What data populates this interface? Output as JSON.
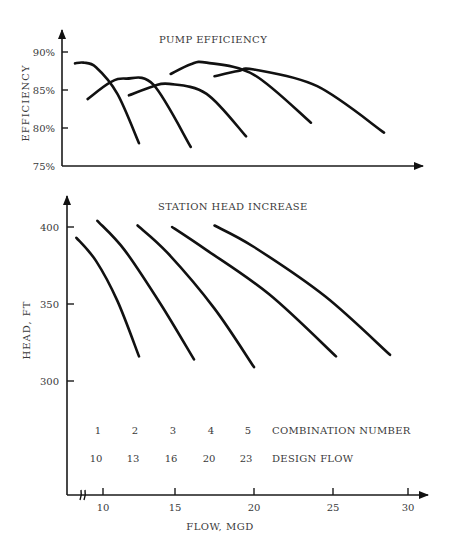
{
  "chart_data": [
    {
      "type": "line",
      "title": "PUMP EFFICIENCY",
      "xlabel": "",
      "ylabel": "EFFICIENCY",
      "y_ticks": [
        "75%",
        "80%",
        "85%",
        "90%"
      ],
      "y_tick_values": [
        75,
        80,
        85,
        90
      ],
      "ylim": [
        75,
        92
      ],
      "xlim": [
        8,
        31
      ],
      "grid": false,
      "legend": "none",
      "series": [
        {
          "name": "Combination 1",
          "x": [
            8.0,
            8.6,
            9.5,
            11.0,
            12.5
          ],
          "y": [
            88.5,
            88.6,
            88.0,
            84.5,
            78.0
          ]
        },
        {
          "name": "Combination 2",
          "x": [
            8.9,
            10.5,
            11.6,
            13.5,
            16.0
          ],
          "y": [
            83.8,
            86.0,
            86.5,
            85.7,
            77.5
          ]
        },
        {
          "name": "Combination 3",
          "x": [
            11.8,
            13.5,
            14.6,
            17.0,
            19.5
          ],
          "y": [
            84.3,
            85.5,
            85.8,
            84.5,
            78.9
          ]
        },
        {
          "name": "Combination 4",
          "x": [
            14.7,
            16.0,
            17.0,
            20.0,
            23.6
          ],
          "y": [
            87.1,
            88.4,
            88.6,
            87.0,
            80.7
          ]
        },
        {
          "name": "Combination 5",
          "x": [
            17.5,
            19.0,
            20.0,
            24.0,
            28.4
          ],
          "y": [
            86.8,
            87.5,
            87.7,
            85.5,
            79.4
          ]
        }
      ]
    },
    {
      "type": "line",
      "title": "STATION HEAD INCREASE",
      "xlabel": "FLOW, MGD",
      "ylabel": "HEAD, FT",
      "x_ticks": [
        "10",
        "15",
        "20",
        "25",
        "30"
      ],
      "x_tick_values": [
        10,
        15,
        20,
        25,
        30
      ],
      "y_ticks": [
        "300",
        "350",
        "400"
      ],
      "y_tick_values": [
        300,
        350,
        400
      ],
      "xlim": [
        8,
        31
      ],
      "x_axis_break": true,
      "grid": false,
      "legend": "none",
      "series": [
        {
          "name": "Combination 1",
          "x": [
            8.1,
            9.5,
            11.0,
            12.5
          ],
          "y": [
            393,
            378,
            352,
            316
          ]
        },
        {
          "name": "Combination 2",
          "x": [
            9.6,
            11.5,
            14.0,
            16.2
          ],
          "y": [
            404,
            385,
            350,
            314
          ]
        },
        {
          "name": "Combination 3",
          "x": [
            12.4,
            14.5,
            17.5,
            20.0
          ],
          "y": [
            401,
            383,
            347,
            309
          ]
        },
        {
          "name": "Combination 4",
          "x": [
            14.8,
            17.0,
            21.0,
            25.2
          ],
          "y": [
            400,
            385,
            356,
            316
          ]
        },
        {
          "name": "Combination 5",
          "x": [
            17.5,
            20.0,
            24.5,
            28.8
          ],
          "y": [
            401,
            387,
            355,
            317
          ]
        }
      ],
      "annotations": {
        "combination_label": "COMBINATION NUMBER",
        "design_flow_label": "DESIGN FLOW",
        "combination_numbers": [
          "1",
          "2",
          "3",
          "4",
          "5"
        ],
        "design_flows": [
          "10",
          "13",
          "16",
          "20",
          "23"
        ]
      }
    }
  ]
}
